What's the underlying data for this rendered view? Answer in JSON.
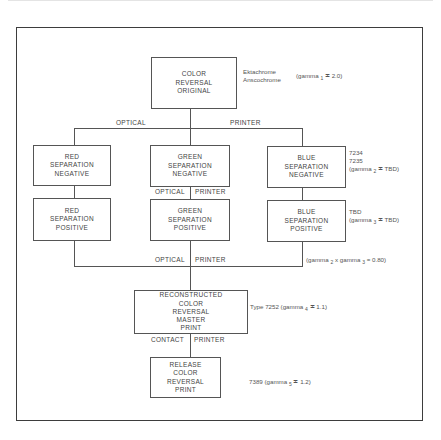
{
  "boxes": {
    "original": [
      "COLOR",
      "REVERSAL",
      "ORIGINAL"
    ],
    "red_neg": [
      "RED",
      "SEPARATION",
      "NEGATIVE"
    ],
    "green_neg": [
      "GREEN",
      "SEPARATION",
      "NEGATIVE"
    ],
    "blue_neg": [
      "BLUE",
      "SEPARATION",
      "NEGATIVE"
    ],
    "red_pos": [
      "RED",
      "SEPARATION",
      "POSITIVE"
    ],
    "green_pos": [
      "GREEN",
      "SEPARATION",
      "POSITIVE"
    ],
    "blue_pos": [
      "BLUE",
      "SEPARATION",
      "POSITIVE"
    ],
    "master": [
      "RECONSTRUCTED",
      "COLOR",
      "REVERSAL",
      "MASTER",
      "PRINT"
    ],
    "release": [
      "RELEASE",
      "COLOR",
      "REVERSAL",
      "PRINT"
    ]
  },
  "labels": {
    "stage1_left": "OPTICAL",
    "stage1_right": "PRINTER",
    "stage2_left": "OPTICAL",
    "stage2_right": "PRINTER",
    "stage3_left": "OPTICAL",
    "stage3_right": "PRINTER",
    "stage4_left": "CONTACT",
    "stage4_right": "PRINTER"
  },
  "notes": {
    "original_films": [
      "Ektachrome",
      "Anscochrome"
    ],
    "original_gamma": "(gamma",
    "original_gamma_sub": "1",
    "original_gamma_val": "≐ 2.0)",
    "neg_films": [
      "7234",
      "7235"
    ],
    "neg_gamma": "(gamma",
    "neg_gamma_sub": "2",
    "neg_gamma_val": "≐ TBD)",
    "pos_film": "TBD",
    "pos_gamma": "(gamma",
    "pos_gamma_sub": "3",
    "pos_gamma_val": "≐ TBD)",
    "product_gamma_a": "(gamma",
    "product_gamma_sub_a": "2",
    "product_gamma_b": "x gamma",
    "product_gamma_sub_b": "3",
    "product_gamma_val": "= 0.80)",
    "master_film": "Type 7252 (gamma",
    "master_gamma_sub": "4",
    "master_gamma_val": "≐ 1.1)",
    "release_film": "7389 (gamma",
    "release_gamma_sub": "5",
    "release_gamma_val": "≐ 1.2)"
  }
}
